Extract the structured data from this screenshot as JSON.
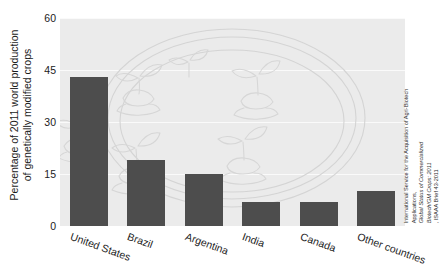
{
  "chart_data": {
    "type": "bar",
    "title": "",
    "subtitle": "",
    "xlabel": "",
    "ylabel": "Percentage of 2011 world production of genetically modified crops",
    "ylabel_line1": "Percentage of 2011 world production",
    "ylabel_line2": "of genetically modified crops",
    "categories": [
      "United States",
      "Brazil",
      "Argentina",
      "India",
      "Canada",
      "Other countries"
    ],
    "values": [
      43,
      19,
      15,
      7,
      7,
      10
    ],
    "ylim": [
      0,
      60
    ],
    "yticks": [
      0,
      15,
      30,
      45,
      60
    ],
    "ytick_labels": [
      "0",
      "15",
      "30",
      "45",
      "60"
    ],
    "grid": true,
    "legend": "none",
    "bar_color": "#4d4d4d",
    "plot_background": "#ebebeb",
    "gridline_color": "#fafafa"
  },
  "source": {
    "line1": "International Service for the Acquisition of Agri-Biotech",
    "line2_plain": "Applications, ",
    "line2_italic": "Global Status of Commercialized",
    "line3_italic": "Biotech/GM Crops: 2011",
    "line3_plain": ", ISAAA Brief 43-2011"
  },
  "watermark": {
    "name": "petri-dish-with-plantlets",
    "color": "#d2d2d2"
  }
}
